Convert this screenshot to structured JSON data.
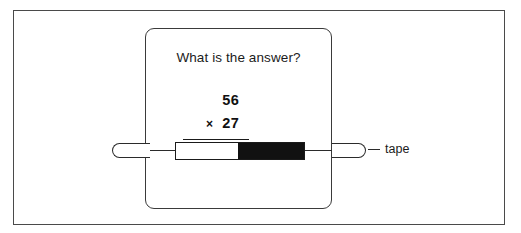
{
  "figure": {
    "background_color": "#ffffff",
    "frame_border_color": "#4a4a4a",
    "card_border_color": "#3a3a3a",
    "ink_color": "#111111"
  },
  "card": {
    "question": "What is the answer?",
    "sum": {
      "multiplicand": "56",
      "operator": "×",
      "multiplier": "27"
    }
  },
  "callout": {
    "label": "tape"
  },
  "tape": {
    "white_segment_color": "#ffffff",
    "black_segment_color": "#111111",
    "outline_color": "#1a1a1a"
  }
}
